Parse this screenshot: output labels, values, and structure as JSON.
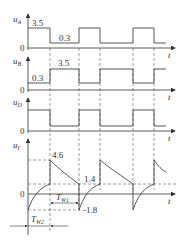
{
  "diagram": {
    "type": "timing-waveforms",
    "time_axis_label": "t",
    "origin_label": "0",
    "transitions": [
      "t1",
      "t2",
      "t3",
      "t4",
      "t5"
    ],
    "waveforms": [
      {
        "id": "uA",
        "label": "u",
        "subscript": "A",
        "high_value": "3.5",
        "low_value": "0.3",
        "initial_state": "high",
        "states": [
          "high",
          "low",
          "high",
          "low",
          "high",
          "low"
        ]
      },
      {
        "id": "uB",
        "label": "u",
        "subscript": "B",
        "high_value": "3.5",
        "low_value": "0.3",
        "initial_state": "low",
        "states": [
          "low",
          "high",
          "low",
          "high",
          "low",
          "high"
        ]
      },
      {
        "id": "uD",
        "label": "u",
        "subscript": "D",
        "initial_state": "high",
        "states": [
          "high",
          "low",
          "high",
          "low",
          "high",
          "low"
        ]
      },
      {
        "id": "uI",
        "label": "u",
        "subscript": "I",
        "peak_value": "4.6",
        "threshold_value": "1.4",
        "trough_value": "-1.8",
        "pulse_width_labels": [
          {
            "label": "T",
            "subscript": "W1"
          },
          {
            "label": "T",
            "subscript": "W2"
          }
        ]
      }
    ]
  }
}
